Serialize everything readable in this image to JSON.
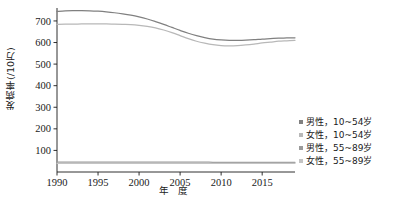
{
  "chart_data": {
    "type": "line",
    "title": "",
    "xlabel": "年 度",
    "ylabel": "发病率(/10万)",
    "xlim": [
      1990,
      2019
    ],
    "ylim": [
      0,
      760
    ],
    "xticks": [
      1990,
      1995,
      2000,
      2005,
      2010,
      2015
    ],
    "yticks": [
      100,
      200,
      300,
      400,
      500,
      600,
      700
    ],
    "grid": false,
    "legend_position": "right",
    "x": [
      1990,
      1991,
      1992,
      1993,
      1994,
      1995,
      1996,
      1997,
      1998,
      1999,
      2000,
      2001,
      2002,
      2003,
      2004,
      2005,
      2006,
      2007,
      2008,
      2009,
      2010,
      2011,
      2012,
      2013,
      2014,
      2015,
      2016,
      2017,
      2018,
      2019
    ],
    "series": [
      {
        "name": "男性，10~54岁",
        "color": "#808080",
        "values": [
          744,
          747,
          748,
          748,
          747,
          745,
          742,
          738,
          733,
          727,
          719,
          709,
          697,
          684,
          670,
          656,
          643,
          632,
          623,
          616,
          612,
          610,
          610,
          611,
          613,
          616,
          618,
          620,
          621,
          622
        ]
      },
      {
        "name": "女性，10~54岁",
        "color": "#b8b8b8",
        "values": [
          684,
          685,
          685,
          686,
          686,
          686,
          686,
          685,
          684,
          683,
          680,
          675,
          668,
          658,
          646,
          632,
          618,
          606,
          597,
          590,
          586,
          585,
          586,
          589,
          593,
          598,
          602,
          606,
          608,
          610
        ]
      },
      {
        "name": "男性，55~89岁",
        "color": "#9a9a9a",
        "values": [
          46,
          46,
          46,
          46,
          46,
          46,
          46,
          46,
          46,
          46,
          46,
          46,
          46,
          46,
          46,
          46,
          46,
          46,
          46,
          45,
          45,
          45,
          45,
          45,
          45,
          45,
          45,
          45,
          45,
          45
        ]
      },
      {
        "name": "女性，55~89岁",
        "color": "#c4c4c4",
        "values": [
          40,
          40,
          40,
          40,
          40,
          40,
          40,
          40,
          40,
          40,
          40,
          40,
          40,
          40,
          40,
          40,
          40,
          40,
          40,
          40,
          40,
          40,
          40,
          40,
          40,
          40,
          40,
          40,
          40,
          40
        ]
      }
    ]
  },
  "legend": {
    "items": [
      {
        "label": "男性，10~54岁",
        "color": "#808080"
      },
      {
        "label": "女性，10~54岁",
        "color": "#b8b8b8"
      },
      {
        "label": "男性，55~89岁",
        "color": "#9a9a9a"
      },
      {
        "label": "女性，55~89岁",
        "color": "#c4c4c4"
      }
    ]
  },
  "axes": {
    "y_title": "发病率(/10万)",
    "x_title": "年 度",
    "x_tick_labels": [
      "1990",
      "1995",
      "2000",
      "2005",
      "2010",
      "2015"
    ],
    "y_tick_labels": [
      "100",
      "200",
      "300",
      "400",
      "500",
      "600",
      "700"
    ]
  },
  "colors": {
    "axis": "#1a1a1a",
    "background": "#ffffff"
  }
}
